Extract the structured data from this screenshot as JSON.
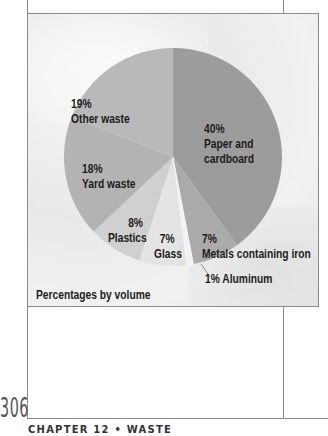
{
  "chart_data": {
    "type": "pie",
    "title": "",
    "caption": "Percentages by volume",
    "categories": [
      "Paper and cardboard",
      "Metals containing iron",
      "Aluminum",
      "Glass",
      "Plastics",
      "Yard waste",
      "Other waste"
    ],
    "values": [
      40,
      7,
      1,
      7,
      8,
      18,
      19
    ],
    "unit": "%",
    "colors": [
      "#9c9c9c",
      "#aaaaaa",
      "#f2f2f2",
      "#e4e4e4",
      "#d0d0d0",
      "#b3b3b3",
      "#b9b9b9"
    ],
    "start_angle": "12 o'clock",
    "direction": "clockwise",
    "labels": [
      {
        "pct": "40%",
        "name": "Paper and",
        "name2": "cardboard"
      },
      {
        "pct": "7%",
        "name": "Metals containing iron"
      },
      {
        "pct": "1%",
        "name": "Aluminum"
      },
      {
        "pct": "7%",
        "name": "Glass"
      },
      {
        "pct": "8%",
        "name": "Plastics"
      },
      {
        "pct": "18%",
        "name": "Yard waste"
      },
      {
        "pct": "19%",
        "name": "Other waste"
      }
    ]
  },
  "page": {
    "number": "306",
    "footer": "CHAPTER 12 • WASTE"
  }
}
